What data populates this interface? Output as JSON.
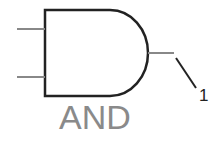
{
  "gate": {
    "type": "AND",
    "label": "AND",
    "inputs": 2,
    "outputs": 1
  },
  "output_pin": {
    "label": "1"
  },
  "colors": {
    "body_stroke": "#222222",
    "wire": "#888888",
    "label": "#8a8a8a"
  }
}
